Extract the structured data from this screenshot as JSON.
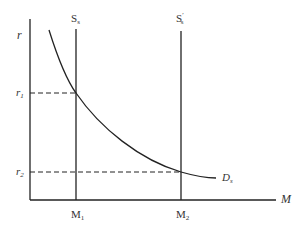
{
  "diagram": {
    "type": "money-market-supply-demand",
    "colors": {
      "line": "#222222",
      "text": "#333333",
      "background": "#ffffff"
    },
    "axes": {
      "y_label": "r",
      "x_label": "M"
    },
    "y_ticks": [
      {
        "base": "r",
        "sub": "1"
      },
      {
        "base": "r",
        "sub": "2"
      }
    ],
    "x_ticks": [
      {
        "base": "M",
        "sub": "1"
      },
      {
        "base": "M",
        "sub": "2"
      }
    ],
    "curves": {
      "supply_1": {
        "base": "S",
        "sub": "s",
        "prime": ""
      },
      "supply_2": {
        "base": "S",
        "sub": "s",
        "prime": "′"
      },
      "demand": {
        "base": "D",
        "sub": "s"
      }
    }
  }
}
